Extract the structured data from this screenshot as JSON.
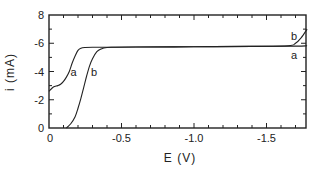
{
  "chart_data": {
    "type": "line",
    "title": "",
    "xlabel": "E (V)",
    "ylabel": "i (mA)",
    "xlim": [
      0,
      -1.78
    ],
    "ylim": [
      0,
      8
    ],
    "x_ticks": [
      0,
      -0.5,
      -1.0,
      -1.5
    ],
    "x_tick_labels": [
      "0",
      "-0.5",
      "-1.0",
      "-1.5"
    ],
    "y_ticks": [
      0,
      2,
      4,
      6,
      8
    ],
    "y_tick_labels": [
      "0",
      "-2",
      "-4",
      "-6",
      "8"
    ],
    "grid": false,
    "legend": "none (curves labeled inline)",
    "series": [
      {
        "name": "a",
        "x": [
          0,
          -0.03,
          -0.06,
          -0.08,
          -0.1,
          -0.12,
          -0.14,
          -0.16,
          -0.18,
          -0.2,
          -0.22,
          -0.25,
          -0.3,
          -0.4,
          -0.6,
          -1.0,
          -1.4,
          -1.7,
          -1.78
        ],
        "values": [
          2.6,
          2.9,
          3.0,
          3.1,
          3.3,
          3.6,
          4.0,
          4.6,
          5.1,
          5.5,
          5.65,
          5.7,
          5.72,
          5.72,
          5.73,
          5.75,
          5.78,
          5.8,
          5.82
        ]
      },
      {
        "name": "b",
        "x": [
          -0.12,
          -0.15,
          -0.18,
          -0.2,
          -0.22,
          -0.24,
          -0.26,
          -0.28,
          -0.3,
          -0.33,
          -0.36,
          -0.4,
          -0.45,
          -0.6,
          -1.0,
          -1.4,
          -1.65,
          -1.7,
          -1.74,
          -1.78
        ],
        "values": [
          0,
          0.3,
          0.8,
          1.4,
          2.1,
          2.9,
          3.7,
          4.4,
          4.9,
          5.4,
          5.6,
          5.7,
          5.72,
          5.73,
          5.75,
          5.78,
          5.82,
          6.0,
          6.4,
          7.0
        ]
      }
    ],
    "annotations": [
      {
        "text": "a",
        "x": -0.17,
        "y": 4.0
      },
      {
        "text": "b",
        "x": -0.31,
        "y": 4.0
      },
      {
        "text": "b",
        "x": -1.69,
        "y": 6.5
      },
      {
        "text": "a",
        "x": -1.69,
        "y": 5.2
      }
    ]
  }
}
